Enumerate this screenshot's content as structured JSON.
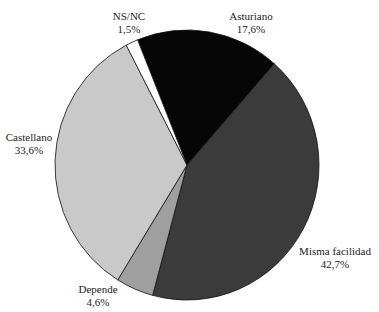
{
  "chart_data": {
    "type": "pie",
    "title": "",
    "categories": [
      "Asturiano",
      "Misma facilidad",
      "Depende",
      "Castellano",
      "NS/NC"
    ],
    "values": [
      17.6,
      42.7,
      4.6,
      33.6,
      1.5
    ],
    "value_labels": [
      "17,6%",
      "42,7%",
      "4,6%",
      "33,6%",
      "1,5%"
    ],
    "colors": [
      "#060606",
      "#3b3b3b",
      "#9f9f9f",
      "#c9c9c9",
      "#ffffff"
    ],
    "start_angle_deg": -22,
    "direction": "clockwise",
    "legend": "none",
    "labels_outside": true
  },
  "labels": [
    {
      "name": "Asturiano",
      "value": "17,6%",
      "x": 251,
      "y": 10
    },
    {
      "name": "Misma facilidad",
      "value": "42,7%",
      "x": 335,
      "y": 245
    },
    {
      "name": "Depende",
      "value": "4,6%",
      "x": 98,
      "y": 283
    },
    {
      "name": "Castellano",
      "value": "33,6%",
      "x": 29,
      "y": 131
    },
    {
      "name": "NS/NC",
      "value": "1,5%",
      "x": 129,
      "y": 10
    }
  ]
}
